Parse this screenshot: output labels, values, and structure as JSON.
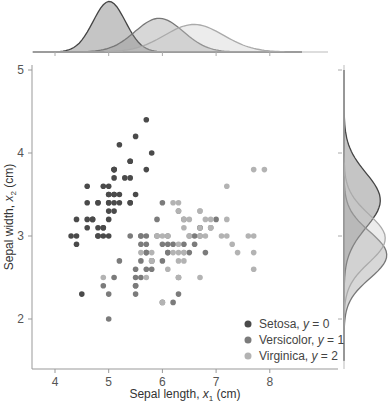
{
  "chart_data": {
    "type": "scatter",
    "subtype": "jointplot-with-marginal-kde",
    "xlabel": "Sepal length, x₁ (cm)",
    "ylabel": "Sepal width, x₂ (cm)",
    "xlim": [
      3.6,
      9.3
    ],
    "ylim": [
      1.4,
      5.05
    ],
    "xticks": [
      4,
      5,
      6,
      7,
      8
    ],
    "yticks": [
      2,
      3,
      4,
      5
    ],
    "grid": false,
    "legend_position": "lower right",
    "series": [
      {
        "name": "Setosa, y = 0",
        "label_main": "Setosa, ",
        "label_var": "y",
        "label_val": " = 0",
        "color": "#4a4a4a",
        "points": [
          [
            5.1,
            3.5
          ],
          [
            4.9,
            3.0
          ],
          [
            4.7,
            3.2
          ],
          [
            4.6,
            3.1
          ],
          [
            5.0,
            3.6
          ],
          [
            5.4,
            3.9
          ],
          [
            4.6,
            3.4
          ],
          [
            5.0,
            3.4
          ],
          [
            4.4,
            2.9
          ],
          [
            4.9,
            3.1
          ],
          [
            5.4,
            3.7
          ],
          [
            4.8,
            3.4
          ],
          [
            4.8,
            3.0
          ],
          [
            4.3,
            3.0
          ],
          [
            5.8,
            4.0
          ],
          [
            5.7,
            4.4
          ],
          [
            5.4,
            3.9
          ],
          [
            5.1,
            3.5
          ],
          [
            5.7,
            3.8
          ],
          [
            5.1,
            3.8
          ],
          [
            5.4,
            3.4
          ],
          [
            5.1,
            3.7
          ],
          [
            4.6,
            3.6
          ],
          [
            5.1,
            3.3
          ],
          [
            4.8,
            3.4
          ],
          [
            5.0,
            3.0
          ],
          [
            5.0,
            3.4
          ],
          [
            5.2,
            3.5
          ],
          [
            5.2,
            3.4
          ],
          [
            4.7,
            3.2
          ],
          [
            4.8,
            3.1
          ],
          [
            5.4,
            3.4
          ],
          [
            5.2,
            4.1
          ],
          [
            5.5,
            4.2
          ],
          [
            4.9,
            3.1
          ],
          [
            5.0,
            3.2
          ],
          [
            5.5,
            3.5
          ],
          [
            4.9,
            3.6
          ],
          [
            4.4,
            3.0
          ],
          [
            5.1,
            3.4
          ],
          [
            5.0,
            3.5
          ],
          [
            4.5,
            2.3
          ],
          [
            4.4,
            3.2
          ],
          [
            5.0,
            3.5
          ],
          [
            5.1,
            3.8
          ],
          [
            4.8,
            3.0
          ],
          [
            5.1,
            3.8
          ],
          [
            4.6,
            3.2
          ],
          [
            5.3,
            3.7
          ],
          [
            5.0,
            3.3
          ]
        ]
      },
      {
        "name": "Versicolor, y = 1",
        "label_main": "Versicolor, ",
        "label_var": "y",
        "label_val": " = 1",
        "color": "#7b7b7b",
        "points": [
          [
            7.0,
            3.2
          ],
          [
            6.4,
            3.2
          ],
          [
            6.9,
            3.1
          ],
          [
            5.5,
            2.3
          ],
          [
            6.5,
            2.8
          ],
          [
            5.7,
            2.8
          ],
          [
            6.3,
            3.3
          ],
          [
            4.9,
            2.4
          ],
          [
            6.6,
            2.9
          ],
          [
            5.2,
            2.7
          ],
          [
            5.0,
            2.0
          ],
          [
            5.9,
            3.0
          ],
          [
            6.0,
            2.2
          ],
          [
            6.1,
            2.9
          ],
          [
            5.6,
            2.9
          ],
          [
            6.7,
            3.1
          ],
          [
            5.6,
            3.0
          ],
          [
            5.8,
            2.7
          ],
          [
            6.2,
            2.2
          ],
          [
            5.6,
            2.5
          ],
          [
            5.9,
            3.2
          ],
          [
            6.1,
            2.8
          ],
          [
            6.3,
            2.5
          ],
          [
            6.1,
            2.8
          ],
          [
            6.4,
            2.9
          ],
          [
            6.6,
            3.0
          ],
          [
            6.8,
            2.8
          ],
          [
            6.7,
            3.0
          ],
          [
            6.0,
            2.9
          ],
          [
            5.7,
            2.6
          ],
          [
            5.5,
            2.4
          ],
          [
            5.5,
            2.4
          ],
          [
            5.8,
            2.7
          ],
          [
            6.0,
            2.7
          ],
          [
            5.4,
            3.0
          ],
          [
            6.0,
            3.4
          ],
          [
            6.7,
            3.1
          ],
          [
            6.3,
            2.3
          ],
          [
            5.6,
            3.0
          ],
          [
            5.5,
            2.5
          ],
          [
            5.5,
            2.6
          ],
          [
            6.1,
            3.0
          ],
          [
            5.8,
            2.6
          ],
          [
            5.0,
            2.3
          ],
          [
            5.6,
            2.7
          ],
          [
            5.7,
            3.0
          ],
          [
            5.7,
            2.9
          ],
          [
            6.2,
            2.9
          ],
          [
            5.1,
            2.5
          ],
          [
            5.7,
            2.8
          ]
        ]
      },
      {
        "name": "Virginica, y = 2",
        "label_main": "Virginica, ",
        "label_var": "y",
        "label_val": " = 2",
        "color": "#b3b3b3",
        "points": [
          [
            6.3,
            3.3
          ],
          [
            5.8,
            2.7
          ],
          [
            7.1,
            3.0
          ],
          [
            6.3,
            2.9
          ],
          [
            6.5,
            3.0
          ],
          [
            7.6,
            3.0
          ],
          [
            4.9,
            2.5
          ],
          [
            7.3,
            2.9
          ],
          [
            6.7,
            2.5
          ],
          [
            7.2,
            3.6
          ],
          [
            6.5,
            3.2
          ],
          [
            6.4,
            2.7
          ],
          [
            6.8,
            3.0
          ],
          [
            5.7,
            2.5
          ],
          [
            5.8,
            2.8
          ],
          [
            6.4,
            3.2
          ],
          [
            6.5,
            3.0
          ],
          [
            7.7,
            3.8
          ],
          [
            7.7,
            2.6
          ],
          [
            6.0,
            2.2
          ],
          [
            6.9,
            3.2
          ],
          [
            5.6,
            2.8
          ],
          [
            7.7,
            2.8
          ],
          [
            6.3,
            2.7
          ],
          [
            6.7,
            3.3
          ],
          [
            7.2,
            3.2
          ],
          [
            6.2,
            2.8
          ],
          [
            6.1,
            3.0
          ],
          [
            6.4,
            2.8
          ],
          [
            7.2,
            3.0
          ],
          [
            7.4,
            2.8
          ],
          [
            7.9,
            3.8
          ],
          [
            6.4,
            2.8
          ],
          [
            6.3,
            2.8
          ],
          [
            6.1,
            2.6
          ],
          [
            7.7,
            3.0
          ],
          [
            6.3,
            3.4
          ],
          [
            6.4,
            3.1
          ],
          [
            6.0,
            3.0
          ],
          [
            6.9,
            3.1
          ],
          [
            6.7,
            3.1
          ],
          [
            6.9,
            3.1
          ],
          [
            5.8,
            2.7
          ],
          [
            6.8,
            3.2
          ],
          [
            6.7,
            3.3
          ],
          [
            6.7,
            3.0
          ],
          [
            6.3,
            2.5
          ],
          [
            6.5,
            3.0
          ],
          [
            6.2,
            3.4
          ],
          [
            5.9,
            3.0
          ]
        ]
      }
    ],
    "marginal_kde": {
      "top": {
        "axis": "x",
        "series": [
          {
            "name": "Setosa",
            "mean": 5.01,
            "sd": 0.3
          },
          {
            "name": "Versicolor",
            "mean": 5.94,
            "sd": 0.45
          },
          {
            "name": "Virginica",
            "mean": 6.59,
            "sd": 0.55
          }
        ]
      },
      "right": {
        "axis": "y",
        "series": [
          {
            "name": "Setosa",
            "mean": 3.43,
            "sd": 0.33
          },
          {
            "name": "Versicolor",
            "mean": 2.77,
            "sd": 0.28
          },
          {
            "name": "Virginica",
            "mean": 2.97,
            "sd": 0.29
          }
        ]
      }
    }
  }
}
